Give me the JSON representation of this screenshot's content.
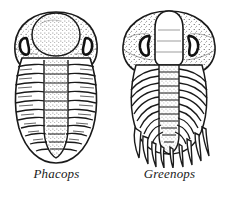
{
  "figure": {
    "background_color": "#ffffff",
    "ink_color": "#1a1a1a",
    "kind": "line-drawing-plate"
  },
  "specimens": [
    {
      "caption": "Phacops",
      "body_outline": "broad rounded oval",
      "glabella": "large inflated stippled bulb",
      "eye_shape": "crescent ring",
      "eye_count": 2,
      "thorax_segment_count": 11,
      "pygidium": "smooth tapering rounded tail",
      "pygidium_margin": "smooth",
      "shading": "stippled"
    },
    {
      "caption": "Greenops",
      "body_outline": "wide cephalon tapering to spiny tail",
      "glabella": "narrow elongated lobe",
      "eye_shape": "crescent ring",
      "eye_count": 2,
      "thorax_segment_count": 11,
      "pygidium": "fringed tail with pointed marginal spines",
      "pygidium_margin": "spiny",
      "pygidium_spine_count": 9,
      "shading": "stippled"
    }
  ]
}
